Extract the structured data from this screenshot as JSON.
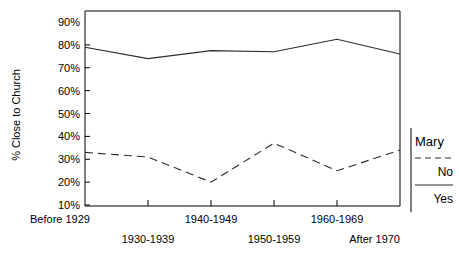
{
  "chart_data": {
    "type": "line",
    "title": "",
    "xlabel": "",
    "ylabel": "% Close to Church",
    "categories": [
      "Before 1929",
      "1930-1939",
      "1940-1949",
      "1950-1959",
      "1960-1969",
      "After 1970"
    ],
    "ylim": [
      10,
      90
    ],
    "ytick_labels": [
      "90%",
      "80%",
      "70%",
      "60%",
      "50%",
      "40%",
      "30%",
      "20%",
      "10%"
    ],
    "ytick_values": [
      90,
      80,
      70,
      60,
      50,
      40,
      30,
      20,
      10
    ],
    "grid": false,
    "legend_position": "right",
    "legend_title": "Mary",
    "series": [
      {
        "name": "Yes",
        "style": "solid",
        "color": "#2b2b2b",
        "values": [
          79,
          74,
          77.5,
          77,
          82.5,
          76
        ]
      },
      {
        "name": "No",
        "style": "dashed",
        "color": "#2b2b2b",
        "values": [
          33,
          31,
          20,
          37,
          25,
          34
        ]
      }
    ]
  },
  "axes": {
    "y_title": "% Close to Church"
  },
  "legend": {
    "title": "Mary",
    "entries": [
      {
        "label": "No",
        "style": "dashed"
      },
      {
        "label": "Yes",
        "style": "solid"
      }
    ]
  }
}
